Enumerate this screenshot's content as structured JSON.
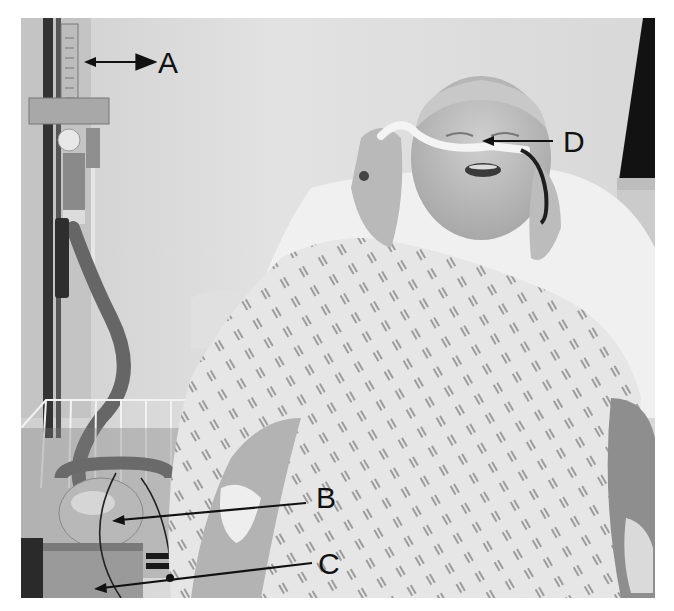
{
  "figure": {
    "type": "annotated-photograph",
    "labels": [
      {
        "id": "A",
        "text": "A",
        "points_to": "flowmeter"
      },
      {
        "id": "B",
        "text": "B",
        "points_to": "humidifier-bottle"
      },
      {
        "id": "C",
        "text": "C",
        "points_to": "device-base"
      },
      {
        "id": "D",
        "text": "D",
        "points_to": "nasal-cannula"
      }
    ],
    "colors": {
      "background": "#ffffff",
      "curtain": "#dedede",
      "gown": "#e8e8e8",
      "gown_pattern": "#7a7a7a",
      "skin": "#b8b8b8",
      "tubing": "#5a5a5a",
      "pole": "#2e2e2e",
      "window": "#111111",
      "annotation": "#111111"
    }
  }
}
